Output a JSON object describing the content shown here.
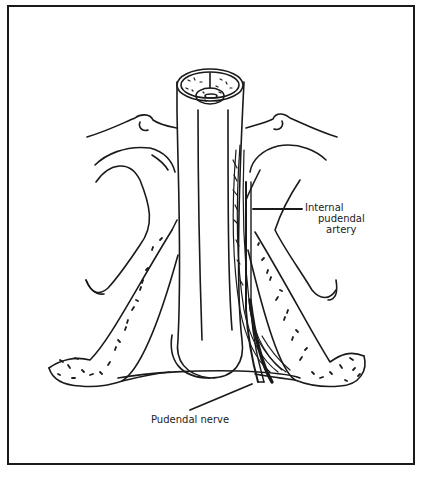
{
  "figure": {
    "colors": {
      "ink": "#1a1a1a",
      "background": "#ffffff"
    },
    "labels": {
      "internal_pudendal_artery": [
        "Internal",
        "pudendal",
        "artery"
      ],
      "pudendal_nerve": "Pudendal nerve"
    }
  }
}
